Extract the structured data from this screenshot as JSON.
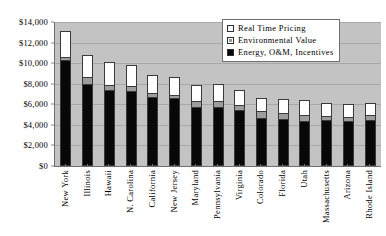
{
  "chart_data": {
    "type": "bar",
    "subtype": "stacked-vertical",
    "title": "",
    "xlabel": "",
    "ylabel": "",
    "ylim": [
      0,
      14000
    ],
    "ytick_labels": [
      "$14,000",
      "$12,000",
      "$10,000",
      "$8,000",
      "$6,000",
      "$4,000",
      "$2,000",
      "$0"
    ],
    "ytick_values": [
      14000,
      12000,
      10000,
      8000,
      6000,
      4000,
      2000,
      0
    ],
    "ytick_step": 2000,
    "grid": true,
    "grid_axis": "y",
    "legend_position": "top-right",
    "plot_background": "#c3c3c3",
    "categories": [
      "New York",
      "Illinois",
      "Hawaii",
      "N. Carolina",
      "California",
      "New Jersey",
      "Maryland",
      "Pennsylvania",
      "Virginia",
      "Colorado",
      "Florida",
      "Utah",
      "Massachusetts",
      "Arizona",
      "Rhode Island"
    ],
    "series": [
      {
        "name": "Energy, O&M, Incentives",
        "color": "#080808",
        "values": [
          10100,
          7800,
          7150,
          7100,
          6550,
          6400,
          5500,
          5550,
          5300,
          4500,
          4350,
          4200,
          4250,
          4150,
          4300
        ]
      },
      {
        "name": "Environmental Value",
        "color": "#9d9d9d",
        "values": [
          200,
          600,
          400,
          350,
          300,
          250,
          500,
          450,
          350,
          550,
          500,
          500,
          350,
          350,
          350
        ]
      },
      {
        "name": "Real Time Pricing",
        "color": "#ffffff",
        "values": [
          2450,
          2000,
          2200,
          2000,
          1600,
          1600,
          1500,
          1550,
          1350,
          1200,
          1250,
          1300,
          1150,
          1150,
          1050
        ]
      }
    ],
    "totals": [
      12750,
      10400,
      9750,
      9450,
      8450,
      8250,
      7500,
      7550,
      7000,
      6250,
      6100,
      6000,
      5750,
      5650,
      5700
    ]
  },
  "legend": {
    "items": [
      {
        "label": "Real Time Pricing",
        "swatch": "white-square-icon"
      },
      {
        "label": "Environmental Value",
        "swatch": "gray-square-icon"
      },
      {
        "label": "Energy, O&M, Incentives",
        "swatch": "black-square-icon"
      }
    ]
  }
}
